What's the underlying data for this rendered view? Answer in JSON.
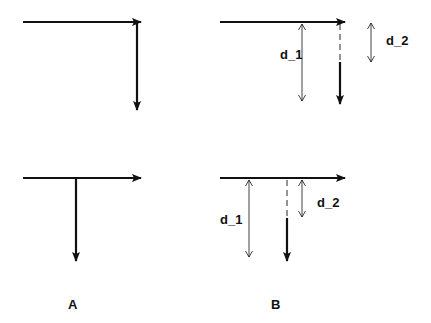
{
  "panels": [
    {
      "id": "A",
      "label": "A"
    },
    {
      "id": "B",
      "label": "B"
    }
  ],
  "labels": {
    "top_d1": "d_1",
    "top_d2": "d_2",
    "bottom_d1": "d_1",
    "bottom_d2": "d_2",
    "panel_a": "A",
    "panel_b": "B"
  },
  "colors": {
    "stroke": "#111111",
    "background": "#ffffff"
  }
}
